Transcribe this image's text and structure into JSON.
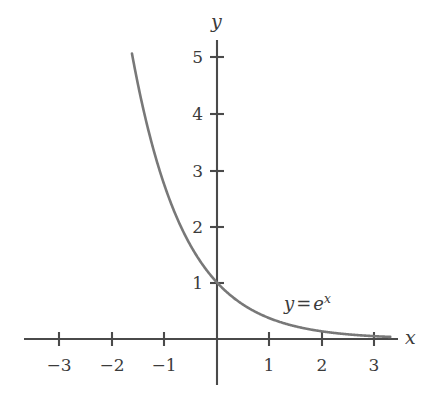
{
  "figure": {
    "background_color": "#ffffff",
    "curve_color": "#787878",
    "axis_color": "#4a4a4a",
    "text_color": "#3b3b3b"
  },
  "axes": {
    "x_axis_name": "x",
    "y_axis_name": "y",
    "origin_px": {
      "x": 217,
      "y": 339
    },
    "x_unit_px": 52.5,
    "y_unit_px": 56.5,
    "x_axis_start_px": 24,
    "x_axis_end_px": 398,
    "y_axis_top_px": 40,
    "y_axis_bottom_px": 385
  },
  "xticks": [
    {
      "value": -3,
      "label": "−3",
      "px": 59
    },
    {
      "value": -2,
      "label": "−2",
      "px": 112
    },
    {
      "value": -1,
      "label": "−1",
      "px": 164
    },
    {
      "value": 1,
      "label": "1",
      "px": 269
    },
    {
      "value": 2,
      "label": "2",
      "px": 322
    },
    {
      "value": 3,
      "label": "3",
      "px": 374
    }
  ],
  "yticks": [
    {
      "value": 1,
      "label": "1",
      "px": 283
    },
    {
      "value": 2,
      "label": "2",
      "px": 227
    },
    {
      "value": 3,
      "label": "3",
      "px": 171
    },
    {
      "value": 4,
      "label": "4",
      "px": 114
    },
    {
      "value": 5,
      "label": "5",
      "px": 57
    }
  ],
  "curve_label": {
    "lhs": "y",
    "operator": "=",
    "base": "e",
    "exponent": "x",
    "full_text": "y = e^x",
    "px": {
      "x": 284,
      "y": 293
    }
  },
  "chart_data": {
    "type": "line",
    "title": "",
    "subtitle": "",
    "xlabel": "x",
    "ylabel": "y",
    "xlim": [
      -3.4,
      3.4
    ],
    "ylim": [
      -0.1,
      5.4
    ],
    "xticks": [
      -3,
      -2,
      -1,
      1,
      2,
      3
    ],
    "yticks": [
      1,
      2,
      3,
      4,
      5
    ],
    "grid": false,
    "legend": false,
    "annotations": [
      {
        "text": "y = e^x",
        "x": 1.28,
        "y": 0.82
      }
    ],
    "series": [
      {
        "name": "y = e^x",
        "color": "#787878",
        "line_width": 2.6,
        "x_start": -1.62,
        "x_end": 3.3,
        "x": [
          -1.62,
          -1.5,
          -1.25,
          -1.0,
          -0.75,
          -0.5,
          -0.25,
          0.0,
          0.25,
          0.5,
          0.75,
          1.0,
          1.25,
          1.5,
          1.75,
          2.0,
          2.25,
          2.5,
          2.75,
          3.0,
          3.3
        ],
        "values": [
          5.05,
          4.48,
          3.49,
          2.72,
          2.12,
          1.65,
          1.28,
          1.0,
          0.78,
          0.61,
          0.47,
          0.37,
          0.29,
          0.22,
          0.17,
          0.14,
          0.11,
          0.08,
          0.06,
          0.05,
          0.04
        ],
        "passes_through": {
          "x": 0,
          "y": 1
        }
      }
    ]
  }
}
